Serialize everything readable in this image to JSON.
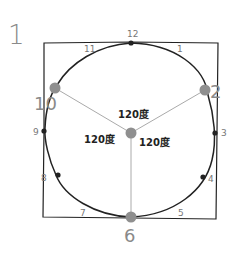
{
  "figure_number": "1",
  "colors": {
    "outline": "#222222",
    "spoke": "#aaaaaa",
    "key_point": "#8f8f8f",
    "label_gray": "#8a8a8a",
    "minor_label": "#777777",
    "angle_text": "#222222"
  },
  "key_points": [
    {
      "label": "10",
      "x": 55,
      "y": 88
    },
    {
      "label": "2",
      "x": 205,
      "y": 90
    },
    {
      "label": "6",
      "x": 131,
      "y": 217
    }
  ],
  "center": {
    "x": 131,
    "y": 133
  },
  "minor_marks": [
    {
      "label": "12",
      "x": 131,
      "y": 43
    },
    {
      "label": "3",
      "x": 215,
      "y": 133
    },
    {
      "label": "4",
      "x": 203,
      "y": 177
    },
    {
      "label": "8",
      "x": 58,
      "y": 175
    },
    {
      "label": "9",
      "x": 44,
      "y": 131
    }
  ],
  "edge_labels": [
    {
      "label": "11",
      "x": 84,
      "y": 52
    },
    {
      "label": "1",
      "x": 177,
      "y": 52
    },
    {
      "label": "12",
      "x": 127,
      "y": 37
    },
    {
      "label": "3",
      "x": 221,
      "y": 136
    },
    {
      "label": "4",
      "x": 208,
      "y": 182
    },
    {
      "label": "5",
      "x": 178,
      "y": 216
    },
    {
      "label": "7",
      "x": 80,
      "y": 216
    },
    {
      "label": "8",
      "x": 41,
      "y": 181
    },
    {
      "label": "9",
      "x": 33,
      "y": 135
    }
  ],
  "angle_labels": [
    {
      "text": "120度",
      "x": 118,
      "y": 118
    },
    {
      "text": "120度",
      "x": 84,
      "y": 143
    },
    {
      "text": "120度",
      "x": 139,
      "y": 146
    }
  ]
}
